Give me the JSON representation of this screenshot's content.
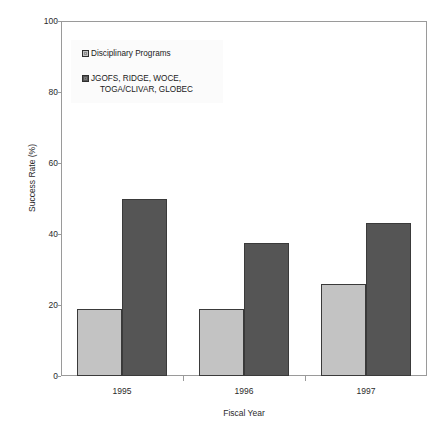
{
  "chart_data": {
    "type": "bar",
    "title": "",
    "subtitle": "",
    "xlabel": "Fiscal Year",
    "ylabel": "Success Rate (%)",
    "categories": [
      "1995",
      "1996",
      "1997"
    ],
    "ylim": [
      0,
      100
    ],
    "yticks": [
      0,
      20,
      40,
      60,
      80,
      100
    ],
    "ytick_labels": [
      "0",
      "20",
      "40",
      "60",
      "80",
      "100"
    ],
    "grid": false,
    "legend_position": "upper-left-inside",
    "series": [
      {
        "name": "Disciplinary Programs",
        "name_lines": [
          "Disciplinary Programs"
        ],
        "color": "#c3c3c3",
        "values": [
          19,
          19,
          26
        ]
      },
      {
        "name": "JGOFS, RIDGE, WOCE, TOGA/CLIVAR, GLOBEC",
        "name_lines": [
          "JGOFS, RIDGE, WOCE,",
          "TOGA/CLIVAR, GLOBEC"
        ],
        "color": "#555555",
        "values": [
          50,
          37.5,
          43
        ]
      }
    ]
  },
  "legend": {
    "entries": [
      {
        "line1": "Disciplinary Programs",
        "line2": ""
      },
      {
        "line1": "JGOFS, RIDGE, WOCE,",
        "line2": "TOGA/CLIVAR, GLOBEC"
      }
    ]
  },
  "axes": {
    "y_title": "Success Rate (%)",
    "x_title": "Fiscal Year",
    "y_labels": [
      "100",
      "80",
      "60",
      "40",
      "20",
      "0"
    ],
    "x_labels": [
      "1995",
      "1996",
      "1997"
    ]
  },
  "colors": {
    "series_light": "#c3c3c3",
    "series_dark": "#555555",
    "frame": "#9a9a9a",
    "bar_outline": "#3a3a3a",
    "text": "#1a1a1a",
    "background": "#ffffff"
  }
}
